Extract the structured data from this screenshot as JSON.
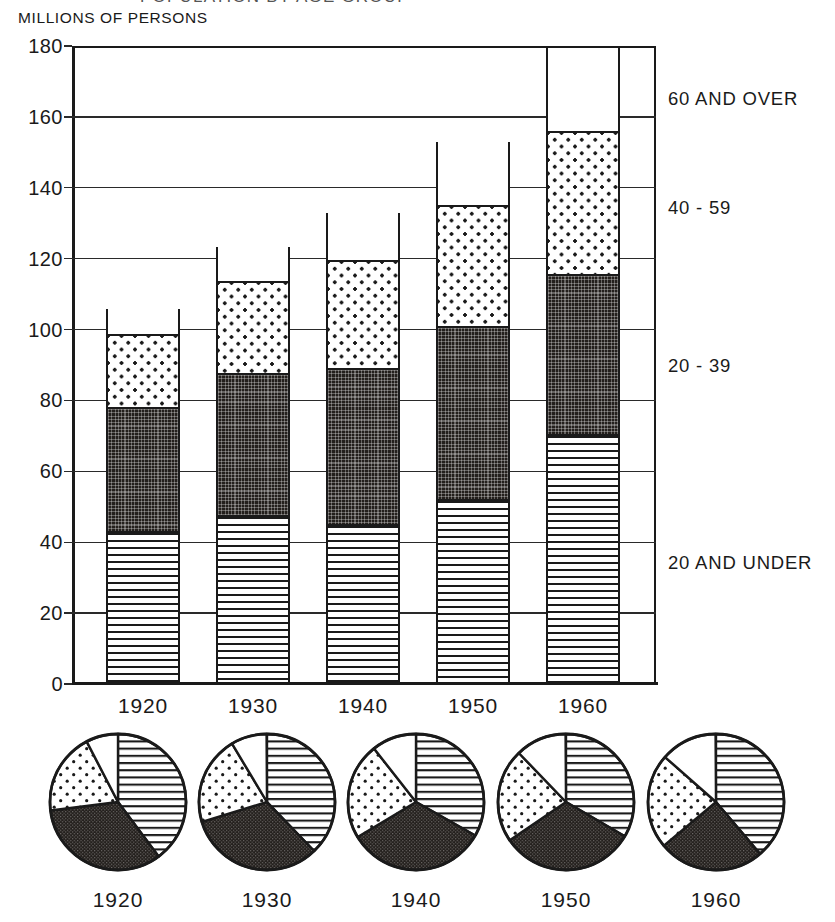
{
  "title_cut": "POPULATION BY AGE GROUP",
  "axis_caption": "MILLIONS OF PERSONS",
  "y_ticks": [
    "180",
    "160",
    "140",
    "120",
    "100",
    "80",
    "60",
    "40",
    "20",
    "0"
  ],
  "x_labels": [
    "1920",
    "1930",
    "1940",
    "1950",
    "1960"
  ],
  "legend": [
    {
      "key": "over60",
      "label": "60 AND OVER",
      "pattern": "white"
    },
    {
      "key": "a40_59",
      "label": "40 - 59",
      "pattern": "dots"
    },
    {
      "key": "a20_39",
      "label": "20 - 39",
      "pattern": "dark"
    },
    {
      "key": "under20",
      "label": "20 AND UNDER",
      "pattern": "hlines"
    }
  ],
  "pie_years": [
    "1920",
    "1930",
    "1940",
    "1950",
    "1960"
  ],
  "colors": {
    "ink": "#1a1a1a",
    "dark_fill": "#231f1c",
    "paper": "#ffffff"
  },
  "chart_data": {
    "type": "bar",
    "title": "POPULATION BY AGE GROUP",
    "xlabel": "",
    "ylabel": "MILLIONS OF PERSONS",
    "ylim": [
      0,
      180
    ],
    "ytick_step": 20,
    "grid": true,
    "stacked": true,
    "legend_position": "right",
    "categories": [
      "1920",
      "1930",
      "1940",
      "1950",
      "1960"
    ],
    "series": [
      {
        "name": "20 AND UNDER",
        "pattern": "horizontal-lines",
        "values": [
          42.0,
          46.5,
          44.0,
          51.0,
          69.5
        ]
      },
      {
        "name": "20 - 39",
        "pattern": "dark-stipple",
        "values": [
          35.0,
          40.0,
          44.0,
          49.0,
          45.0
        ]
      },
      {
        "name": "40 - 59",
        "pattern": "light-dots",
        "values": [
          20.5,
          26.0,
          30.5,
          34.0,
          40.5
        ]
      },
      {
        "name": "60 AND OVER",
        "pattern": "white",
        "values": [
          8.0,
          10.5,
          14.0,
          18.5,
          24.0
        ]
      }
    ],
    "cumulative_tops": {
      "1920": [
        42.0,
        77.0,
        97.5,
        105.5
      ],
      "1930": [
        46.5,
        86.5,
        112.5,
        123.0
      ],
      "1940": [
        44.0,
        88.0,
        118.5,
        132.5
      ],
      "1950": [
        51.0,
        100.0,
        134.0,
        152.5
      ],
      "1960": [
        69.5,
        114.5,
        155.0,
        179.0
      ]
    },
    "totals": [
      105.5,
      123.0,
      132.5,
      152.5,
      179.0
    ]
  },
  "pie_data": {
    "type": "pie",
    "title": "AGE DISTRIBUTION BY YEAR (PERCENT)",
    "slice_order": [
      "20 AND UNDER",
      "20 - 39",
      "40 - 59",
      "60 AND OVER"
    ],
    "patterns": [
      "horizontal-lines",
      "dark-stipple",
      "light-dots",
      "white"
    ],
    "charts": [
      {
        "year": "1920",
        "percents": [
          39.8,
          33.2,
          19.4,
          7.6
        ]
      },
      {
        "year": "1930",
        "percents": [
          37.8,
          32.5,
          21.1,
          8.5
        ]
      },
      {
        "year": "1940",
        "percents": [
          33.2,
          33.2,
          23.0,
          10.6
        ]
      },
      {
        "year": "1950",
        "percents": [
          33.4,
          32.1,
          22.3,
          12.1
        ]
      },
      {
        "year": "1960",
        "percents": [
          38.8,
          25.1,
          22.6,
          13.4
        ]
      }
    ]
  }
}
